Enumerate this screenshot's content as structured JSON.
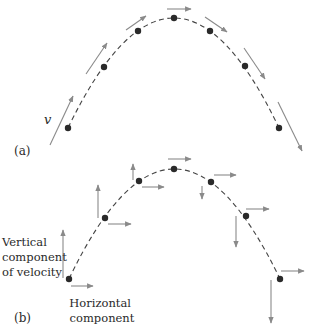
{
  "panel_a": {
    "label": "(a)",
    "velocity_symbol": "v",
    "points": [
      {
        "x": 68,
        "y": 128
      },
      {
        "x": 104,
        "y": 67
      },
      {
        "x": 138,
        "y": 31
      },
      {
        "x": 174,
        "y": 18
      },
      {
        "x": 210,
        "y": 31
      },
      {
        "x": 245,
        "y": 66
      },
      {
        "x": 279,
        "y": 128
      }
    ],
    "velocity_arrows": [
      {
        "x1": 50,
        "y1": 145,
        "x2": 73,
        "y2": 96
      },
      {
        "x1": 86,
        "y1": 74,
        "x2": 107,
        "y2": 43
      },
      {
        "x1": 126,
        "y1": 30,
        "x2": 146,
        "y2": 16
      },
      {
        "x1": 167,
        "y1": 9,
        "x2": 191,
        "y2": 9
      },
      {
        "x1": 205,
        "y1": 17,
        "x2": 227,
        "y2": 32
      },
      {
        "x1": 244,
        "y1": 48,
        "x2": 265,
        "y2": 79
      },
      {
        "x1": 278,
        "y1": 102,
        "x2": 302,
        "y2": 151
      }
    ]
  },
  "panel_b": {
    "label": "(b)",
    "vertical_label": [
      "Vertical",
      "component",
      "of velocity"
    ],
    "horizontal_label": [
      "Horizontal",
      "component"
    ],
    "points": [
      {
        "x": 69,
        "y": 279
      },
      {
        "x": 105,
        "y": 218
      },
      {
        "x": 139,
        "y": 181
      },
      {
        "x": 174,
        "y": 169
      },
      {
        "x": 211,
        "y": 182
      },
      {
        "x": 246,
        "y": 216
      },
      {
        "x": 280,
        "y": 279
      }
    ],
    "horizontal_arrows": [
      {
        "x1": 71,
        "y1": 286,
        "x2": 93,
        "y2": 286
      },
      {
        "x1": 108,
        "y1": 224,
        "x2": 131,
        "y2": 224
      },
      {
        "x1": 142,
        "y1": 187,
        "x2": 164,
        "y2": 187
      },
      {
        "x1": 168,
        "y1": 159,
        "x2": 191,
        "y2": 159
      },
      {
        "x1": 214,
        "y1": 175,
        "x2": 236,
        "y2": 175
      },
      {
        "x1": 246,
        "y1": 209,
        "x2": 269,
        "y2": 209
      },
      {
        "x1": 281,
        "y1": 271,
        "x2": 304,
        "y2": 271
      }
    ],
    "vertical_arrows": [
      {
        "x1": 63,
        "y1": 278,
        "x2": 63,
        "y2": 230
      },
      {
        "x1": 98,
        "y1": 218,
        "x2": 98,
        "y2": 185
      },
      {
        "x1": 133,
        "y1": 180,
        "x2": 133,
        "y2": 164
      },
      {
        "x1": 202,
        "y1": 186,
        "x2": 202,
        "y2": 199
      },
      {
        "x1": 236,
        "y1": 216,
        "x2": 236,
        "y2": 247
      },
      {
        "x1": 271,
        "y1": 280,
        "x2": 271,
        "y2": 323
      }
    ]
  }
}
